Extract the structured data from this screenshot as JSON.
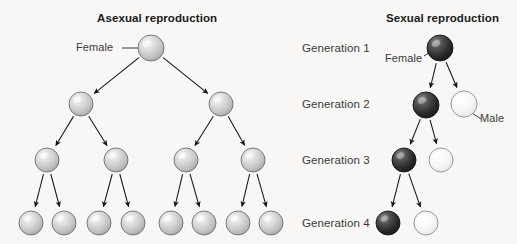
{
  "canvas": {
    "width": 517,
    "height": 244,
    "background": "#f8f7f5"
  },
  "palette": {
    "grey_sphere_light": "#f2f2f2",
    "grey_sphere_mid": "#c9c9c9",
    "grey_sphere_dark": "#a8a8a8",
    "grey_sphere_stroke": "#6e6e6e",
    "dark_sphere_light": "#8a8a8a",
    "dark_sphere_mid": "#3d3d3d",
    "dark_sphere_dark": "#1c1c1c",
    "dark_sphere_stroke": "#141414",
    "white_sphere_light": "#ffffff",
    "white_sphere_mid": "#f4f4f2",
    "white_sphere_dark": "#e2e2df",
    "white_sphere_stroke": "#8d8d8d",
    "arrow": "#1a1a1a",
    "leader_line": "#3a3a3a",
    "text": "#3a3a3a",
    "title_text": "#1a1a1a"
  },
  "asexual_panel": {
    "title": "Asexual reproduction",
    "title_x": 97,
    "title_y": 12,
    "female_label": "Female",
    "female_label_x": 76,
    "female_label_y": 41,
    "female_leader": {
      "x1": 122,
      "y1": 48,
      "x2": 138,
      "y2": 48
    },
    "nodes": [
      {
        "id": "a1",
        "generation": 1,
        "cx": 151,
        "cy": 48,
        "r": 13,
        "type": "grey"
      },
      {
        "id": "a2a",
        "generation": 2,
        "cx": 81,
        "cy": 104,
        "r": 12,
        "type": "grey"
      },
      {
        "id": "a2b",
        "generation": 2,
        "cx": 221,
        "cy": 104,
        "r": 12,
        "type": "grey"
      },
      {
        "id": "a3a",
        "generation": 3,
        "cx": 47,
        "cy": 160,
        "r": 12,
        "type": "grey"
      },
      {
        "id": "a3b",
        "generation": 3,
        "cx": 116,
        "cy": 160,
        "r": 12,
        "type": "grey"
      },
      {
        "id": "a3c",
        "generation": 3,
        "cx": 186,
        "cy": 160,
        "r": 12,
        "type": "grey"
      },
      {
        "id": "a3d",
        "generation": 3,
        "cx": 253,
        "cy": 160,
        "r": 12,
        "type": "grey"
      },
      {
        "id": "a4a",
        "generation": 4,
        "cx": 31,
        "cy": 223,
        "r": 12,
        "type": "grey"
      },
      {
        "id": "a4b",
        "generation": 4,
        "cx": 64,
        "cy": 223,
        "r": 12,
        "type": "grey"
      },
      {
        "id": "a4c",
        "generation": 4,
        "cx": 99,
        "cy": 223,
        "r": 12,
        "type": "grey"
      },
      {
        "id": "a4d",
        "generation": 4,
        "cx": 133,
        "cy": 223,
        "r": 12,
        "type": "grey"
      },
      {
        "id": "a4e",
        "generation": 4,
        "cx": 171,
        "cy": 223,
        "r": 12,
        "type": "grey"
      },
      {
        "id": "a4f",
        "generation": 4,
        "cx": 204,
        "cy": 223,
        "r": 12,
        "type": "grey"
      },
      {
        "id": "a4g",
        "generation": 4,
        "cx": 238,
        "cy": 223,
        "r": 12,
        "type": "grey"
      },
      {
        "id": "a4h",
        "generation": 4,
        "cx": 271,
        "cy": 223,
        "r": 12,
        "type": "grey"
      }
    ],
    "edges": [
      {
        "from": "a1",
        "to": "a2a"
      },
      {
        "from": "a1",
        "to": "a2b"
      },
      {
        "from": "a2a",
        "to": "a3a"
      },
      {
        "from": "a2a",
        "to": "a3b"
      },
      {
        "from": "a2b",
        "to": "a3c"
      },
      {
        "from": "a2b",
        "to": "a3d"
      },
      {
        "from": "a3a",
        "to": "a4a"
      },
      {
        "from": "a3a",
        "to": "a4b"
      },
      {
        "from": "a3b",
        "to": "a4c"
      },
      {
        "from": "a3b",
        "to": "a4d"
      },
      {
        "from": "a3c",
        "to": "a4e"
      },
      {
        "from": "a3c",
        "to": "a4f"
      },
      {
        "from": "a3d",
        "to": "a4g"
      },
      {
        "from": "a3d",
        "to": "a4h"
      }
    ]
  },
  "sexual_panel": {
    "title": "Sexual reproduction",
    "title_x": 386,
    "title_y": 12,
    "female_label": "Female",
    "female_label_x": 385,
    "female_label_y": 52,
    "female_leader": {
      "x1": 424,
      "y1": 56,
      "x2": 437,
      "y2": 48
    },
    "male_label": "Male",
    "male_label_x": 480,
    "male_label_y": 112,
    "male_leader": {
      "x1": 472,
      "y1": 113,
      "x2": 481,
      "y2": 119
    },
    "nodes": [
      {
        "id": "s1",
        "generation": 1,
        "cx": 440,
        "cy": 48,
        "r": 13,
        "type": "dark"
      },
      {
        "id": "s2f",
        "generation": 2,
        "cx": 426,
        "cy": 105,
        "r": 13,
        "type": "dark"
      },
      {
        "id": "s2m",
        "generation": 2,
        "cx": 464,
        "cy": 104,
        "r": 13,
        "type": "white"
      },
      {
        "id": "s3f",
        "generation": 3,
        "cx": 404,
        "cy": 160,
        "r": 12,
        "type": "dark"
      },
      {
        "id": "s3m",
        "generation": 3,
        "cx": 441,
        "cy": 160,
        "r": 12,
        "type": "white"
      },
      {
        "id": "s4f",
        "generation": 4,
        "cx": 388,
        "cy": 223,
        "r": 12,
        "type": "dark"
      },
      {
        "id": "s4m",
        "generation": 4,
        "cx": 426,
        "cy": 223,
        "r": 12,
        "type": "white"
      }
    ],
    "edges": [
      {
        "from": "s1",
        "to": "s2f"
      },
      {
        "from": "s1",
        "to": "s2m"
      },
      {
        "from": "s2f",
        "to": "s3f"
      },
      {
        "from": "s2f",
        "to": "s3m"
      },
      {
        "from": "s3f",
        "to": "s4f"
      },
      {
        "from": "s3f",
        "to": "s4m"
      }
    ]
  },
  "generation_labels": [
    {
      "text": "Generation 1",
      "x": 302,
      "y": 42
    },
    {
      "text": "Generation 2",
      "x": 302,
      "y": 98
    },
    {
      "text": "Generation 3",
      "x": 302,
      "y": 154
    },
    {
      "text": "Generation 4",
      "x": 302,
      "y": 217
    }
  ]
}
